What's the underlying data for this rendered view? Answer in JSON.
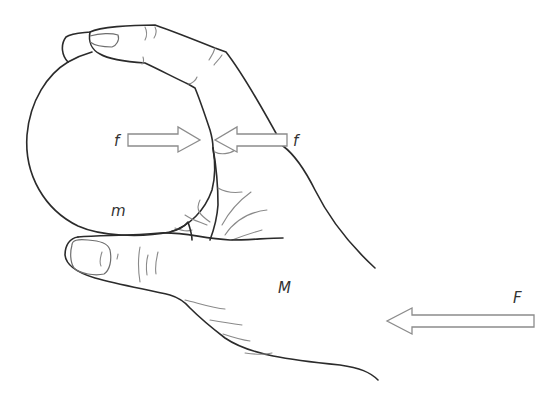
{
  "diagram": {
    "type": "physics-free-body-illustration",
    "labels": {
      "ball_mass": "m",
      "hand_mass": "M",
      "applied_force": "F",
      "friction_left": "f",
      "friction_right": "f"
    },
    "arrows": [
      {
        "name": "friction-on-ball",
        "label": "f",
        "direction": "right",
        "from": [
          128,
          140
        ],
        "to": [
          200,
          140
        ]
      },
      {
        "name": "friction-on-hand",
        "label": "f",
        "direction": "left",
        "from": [
          287,
          140
        ],
        "to": [
          215,
          140
        ]
      },
      {
        "name": "applied-force",
        "label": "F",
        "direction": "left",
        "from": [
          534,
          321
        ],
        "to": [
          387,
          321
        ]
      }
    ],
    "colors": {
      "outline": "#2b2b2b",
      "crease": "#8a8a8a",
      "arrow_stroke": "#8c8c8c",
      "label": "#333333",
      "background": "#ffffff"
    }
  }
}
